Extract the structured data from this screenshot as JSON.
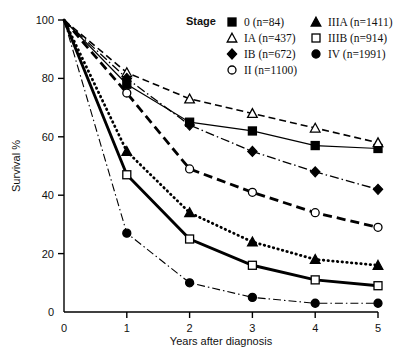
{
  "chart_data": {
    "type": "line",
    "title": "",
    "xlabel": "Years after diagnosis",
    "ylabel": "Survival %",
    "xlim": [
      0,
      5
    ],
    "ylim": [
      0,
      100
    ],
    "xticks": [
      0,
      1,
      2,
      3,
      4,
      5
    ],
    "yticks": [
      0,
      20,
      40,
      60,
      80,
      100
    ],
    "grid": false,
    "legend_title": "Stage",
    "legend_position": "top-right",
    "x": [
      0,
      1,
      2,
      3,
      4,
      5
    ],
    "series": [
      {
        "name": "0",
        "label": "0",
        "n": 84,
        "legend": "0  (n=84)",
        "marker": "filled-square",
        "line": "solid-thin",
        "values": [
          100,
          78,
          65,
          62,
          57,
          56
        ]
      },
      {
        "name": "IA",
        "label": "IA",
        "n": 437,
        "legend": "IA (n=437)",
        "marker": "open-triangle",
        "line": "dashed",
        "values": [
          100,
          82,
          73,
          68,
          63,
          58
        ]
      },
      {
        "name": "IB",
        "label": "IB",
        "n": 672,
        "legend": "IB (n=672)",
        "marker": "filled-diamond",
        "line": "dash-dot",
        "values": [
          100,
          80,
          64,
          55,
          48,
          42
        ]
      },
      {
        "name": "II",
        "label": "II",
        "n": 1100,
        "legend": "II  (n=1100)",
        "marker": "open-circle",
        "line": "long-dash",
        "values": [
          100,
          75,
          49,
          41,
          34,
          29
        ]
      },
      {
        "name": "IIIA",
        "label": "IIIA",
        "n": 1411,
        "legend": "IIIA (n=1411)",
        "marker": "filled-triangle",
        "line": "dotted",
        "values": [
          100,
          55,
          34,
          24,
          18,
          16
        ]
      },
      {
        "name": "IIIB",
        "label": "IIIB",
        "n": 914,
        "legend": "IIIB (n=914)",
        "marker": "open-square",
        "line": "solid-thick",
        "values": [
          100,
          47,
          25,
          16,
          11,
          9
        ]
      },
      {
        "name": "IV",
        "label": "IV",
        "n": 1991,
        "legend": "IV  (n=1991)",
        "marker": "filled-circle",
        "line": "thin-dash-dot",
        "values": [
          100,
          27,
          10,
          5,
          3,
          3
        ]
      }
    ]
  },
  "axes": {
    "ylabel": "Survival %",
    "xlabel": "Years after diagnosis",
    "yticks": [
      "100",
      "80",
      "60",
      "40",
      "20",
      "0"
    ],
    "xticks": [
      "0",
      "1",
      "2",
      "3",
      "4",
      "5"
    ]
  },
  "legend": {
    "title": "Stage",
    "col1": [
      {
        "marker": "filled-square",
        "text": "0   (n=84)"
      },
      {
        "marker": "open-triangle",
        "text": "IA (n=437)"
      },
      {
        "marker": "filled-diamond",
        "text": "IB (n=672)"
      },
      {
        "marker": "open-circle",
        "text": "II  (n=1100)"
      }
    ],
    "col2": [
      {
        "marker": "filled-triangle",
        "text": "IIIA (n=1411)"
      },
      {
        "marker": "open-square",
        "text": "IIIB (n=914)"
      },
      {
        "marker": "filled-circle",
        "text": "IV  (n=1991)"
      }
    ]
  }
}
